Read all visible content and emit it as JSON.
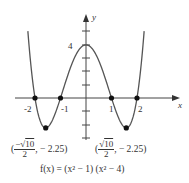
{
  "chart_data": {
    "type": "line",
    "title": "",
    "function_label": "f(x) = (x² − 1) (x² − 4)",
    "xlabel": "x",
    "ylabel": "y",
    "xlim": [
      -2.25,
      2.25
    ],
    "ylim": [
      -3,
      6
    ],
    "x_tick_labels": [
      "-2",
      "-1",
      "1",
      "2"
    ],
    "y_tick_labels": [
      "4"
    ],
    "y_ticks": [
      -3,
      -2,
      -1,
      1,
      2,
      3,
      4,
      5
    ],
    "grid": false,
    "series": [
      {
        "name": "f(x)",
        "x": [
          -2.2,
          -2.0,
          -1.8,
          -1.58,
          -1.4,
          -1.2,
          -1.0,
          -0.8,
          -0.6,
          -0.4,
          -0.2,
          0,
          0.2,
          0.4,
          0.6,
          0.8,
          1.0,
          1.2,
          1.4,
          1.58,
          1.8,
          2.0,
          2.2
        ],
        "y": [
          3.23,
          0,
          -1.52,
          -2.25,
          -1.98,
          -1.06,
          0,
          0.86,
          2.13,
          3.23,
          3.84,
          4,
          3.84,
          3.23,
          2.13,
          0.86,
          0,
          -1.06,
          -1.98,
          -2.25,
          -1.52,
          0,
          3.23
        ]
      }
    ],
    "marked_points": [
      {
        "x": -2,
        "y": 0
      },
      {
        "x": -1,
        "y": 0
      },
      {
        "x": 1,
        "y": 0
      },
      {
        "x": 2,
        "y": 0
      },
      {
        "x": -1.58,
        "y": -2.25
      },
      {
        "x": 1.58,
        "y": -2.25
      }
    ],
    "annotations": {
      "left_min": {
        "open": "(",
        "num_sign": "−",
        "num_root": "√",
        "num_val": "10",
        "den": "2",
        "rest": ", − 2.25)"
      },
      "right_min": {
        "open": "(",
        "num_sign": "",
        "num_root": "√",
        "num_val": "10",
        "den": "2",
        "rest": ", − 2.25)"
      }
    }
  }
}
